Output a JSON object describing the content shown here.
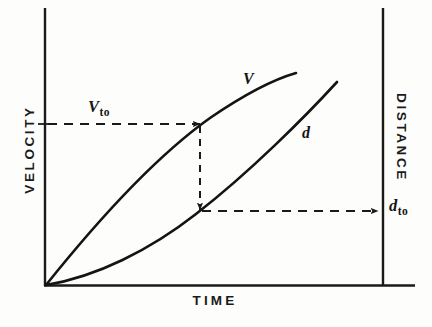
{
  "figure": {
    "kind": "line-diagram",
    "background_color": "#fdfdfc",
    "ink_color": "#1a1a1a",
    "axes": {
      "left": {
        "label": "VELOCITY",
        "orientation": "vertical-rotated-ccw",
        "x": 45,
        "y_top": 8,
        "y_bottom": 285
      },
      "right": {
        "label": "DISTANCE",
        "orientation": "vertical-rotated-cw",
        "x": 383,
        "y_top": 8,
        "y_bottom": 285
      },
      "bottom": {
        "label": "TIME",
        "orientation": "horizontal",
        "y": 285,
        "x_left": 45,
        "x_right": 415
      }
    },
    "curves": [
      {
        "name": "velocity-curve",
        "label": "V",
        "shape": "concave-down increasing",
        "description": "Velocity rises steeply from the origin then flattens toward the top right",
        "path": "M 46 285 C 110 205, 165 150, 210 118 C 248 92, 275 79, 296 73",
        "stroke_width": 2.6
      },
      {
        "name": "distance-curve",
        "label": "d",
        "shape": "concave-up increasing",
        "description": "Distance leaves the origin nearly flat then steepens to the upper right",
        "path": "M 46 285 C 96 277, 150 250, 196 214 C 250 172, 305 117, 337 82",
        "stroke_width": 2.6
      }
    ],
    "construction_lines": [
      {
        "name": "vto-horizontal-arrow",
        "from": [
          46,
          124
        ],
        "to": [
          200,
          124
        ],
        "style": "dashed",
        "arrowhead": "end-right",
        "label": "V_to"
      },
      {
        "name": "drop-vertical-arrow",
        "from": [
          200,
          124
        ],
        "to": [
          200,
          211
        ],
        "style": "dashed",
        "arrowhead": "end-down"
      },
      {
        "name": "dto-horizontal-arrow",
        "from": [
          200,
          211
        ],
        "to": [
          378,
          211
        ],
        "style": "dashed",
        "arrowhead": "end-right",
        "label": "d_to"
      }
    ],
    "ticks": [
      {
        "name": "vto-tick",
        "axis": "left",
        "x_from": 38,
        "x_to": 52,
        "y": 124
      },
      {
        "name": "dto-tick",
        "axis": "right",
        "y": 211
      }
    ],
    "markers": {
      "vto": {
        "base": "V",
        "subscript": "to"
      },
      "dto": {
        "base": "d",
        "subscript": "to"
      }
    }
  }
}
